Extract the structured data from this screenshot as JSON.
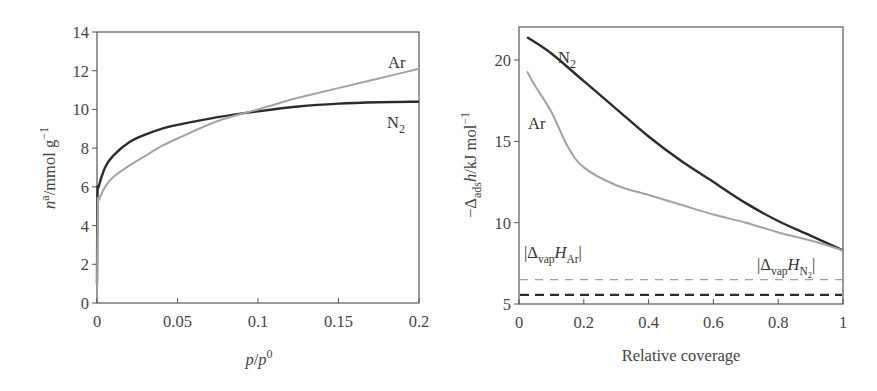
{
  "chart_data": [
    {
      "type": "line",
      "title": "",
      "xlabel": "p/p0",
      "ylabel": "n^a/mmol g^-1",
      "xlim": [
        0,
        0.2
      ],
      "ylim": [
        0,
        14
      ],
      "xticks": [
        "0",
        "0.05",
        "0.1",
        "0.15",
        "0.2"
      ],
      "yticks": [
        "0",
        "2",
        "4",
        "6",
        "8",
        "10",
        "12",
        "14"
      ],
      "grid": false,
      "legend": "inline labels",
      "series": [
        {
          "name": "N2",
          "color": "#2b2b2b",
          "x": [
            0,
            0.0003,
            0.001,
            0.005,
            0.01,
            0.02,
            0.03,
            0.04,
            0.05,
            0.075,
            0.1,
            0.125,
            0.15,
            0.175,
            0.2
          ],
          "y": [
            1.0,
            5.6,
            6.0,
            7.0,
            7.6,
            8.3,
            8.7,
            9.0,
            9.2,
            9.6,
            9.9,
            10.15,
            10.3,
            10.37,
            10.4
          ]
        },
        {
          "name": "Ar",
          "color": "#a3a3a3",
          "x": [
            0,
            0.0005,
            0.001,
            0.005,
            0.01,
            0.02,
            0.03,
            0.04,
            0.05,
            0.075,
            0.1,
            0.125,
            0.15,
            0.175,
            0.2
          ],
          "y": [
            1.0,
            5.1,
            5.3,
            6.0,
            6.5,
            7.1,
            7.6,
            8.1,
            8.5,
            9.4,
            10.0,
            10.6,
            11.1,
            11.6,
            12.1
          ]
        }
      ]
    },
    {
      "type": "line",
      "title": "",
      "xlabel": "Relative coverage",
      "ylabel": "-Δads h / kJ mol^-1",
      "xlim": [
        0,
        1
      ],
      "ylim": [
        5,
        22
      ],
      "xticks": [
        "0",
        "0.2",
        "0.4",
        "0.6",
        "0.8",
        "1"
      ],
      "yticks": [
        "5",
        "10",
        "15",
        "20"
      ],
      "grid": false,
      "legend": "inline labels",
      "series": [
        {
          "name": "N2",
          "color": "#2b2b2b",
          "x": [
            0.025,
            0.1,
            0.2,
            0.3,
            0.4,
            0.5,
            0.6,
            0.7,
            0.8,
            0.9,
            1.0
          ],
          "y": [
            21.4,
            20.4,
            18.7,
            17.0,
            15.3,
            13.8,
            12.5,
            11.2,
            10.1,
            9.2,
            8.3
          ]
        },
        {
          "name": "Ar",
          "color": "#a3a3a3",
          "x": [
            0.025,
            0.05,
            0.1,
            0.15,
            0.2,
            0.3,
            0.4,
            0.5,
            0.6,
            0.7,
            0.8,
            0.9,
            1.0
          ],
          "y": [
            19.3,
            18.4,
            16.8,
            14.7,
            13.4,
            12.3,
            11.7,
            11.1,
            10.5,
            10.0,
            9.4,
            8.9,
            8.3
          ]
        },
        {
          "name": "|Δvap H Ar|",
          "style": "dashed",
          "color": "#a3a3a3",
          "x": [
            0,
            1
          ],
          "y": [
            6.5,
            6.5
          ]
        },
        {
          "name": "|Δvap H N2|",
          "style": "dashed",
          "color": "#2b2b2b",
          "x": [
            0,
            1
          ],
          "y": [
            5.56,
            5.56
          ]
        }
      ],
      "annotations": [
        "|Δvap H Ar|",
        "|Δvap H N2|"
      ]
    }
  ],
  "left": {
    "ylabel_main": "n",
    "ylabel_sup": "a",
    "ylabel_rest": "/mmol g",
    "ylabel_exp": "−1",
    "xlabel_p1": "p",
    "xlabel_slash": "/",
    "xlabel_p2": "p",
    "xlabel_sup": "0",
    "label_ar": "Ar",
    "label_n2_main": "N",
    "label_n2_sub": "2",
    "xticks": [
      "0",
      "0.05",
      "0.1",
      "0.15",
      "0.2"
    ],
    "yticks": [
      "0",
      "2",
      "4",
      "6",
      "8",
      "10",
      "12",
      "14"
    ]
  },
  "right": {
    "ylabel_minus": "−Δ",
    "ylabel_sub": "ads",
    "ylabel_h": "h",
    "ylabel_rest": "/kJ mol",
    "ylabel_exp": "−1",
    "xlabel": "Relative coverage",
    "label_n2_main": "N",
    "label_n2_sub": "2",
    "label_ar": "Ar",
    "ann_ar_open": "|Δ",
    "ann_ar_sub": "vap",
    "ann_ar_h": "H",
    "ann_ar_sub2": "Ar",
    "ann_ar_close": "|",
    "ann_n2_open": "|Δ",
    "ann_n2_sub": "vap",
    "ann_n2_h": "H",
    "ann_n2_sub2": "N",
    "ann_n2_sub3": "2",
    "ann_n2_close": "|",
    "xticks": [
      "0",
      "0.2",
      "0.4",
      "0.6",
      "0.8",
      "1"
    ],
    "yticks": [
      "5",
      "10",
      "15",
      "20"
    ]
  }
}
